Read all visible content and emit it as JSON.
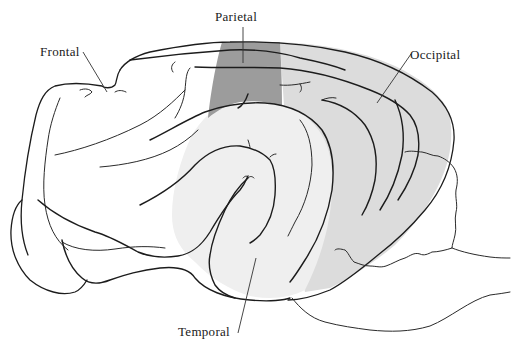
{
  "figure": {
    "labels": {
      "frontal": "Frontal",
      "parietal": "Parietal",
      "occipital": "Occipital",
      "temporal": "Temporal"
    },
    "colors": {
      "parietal_fill": "#9c9c9c",
      "occipital_fill": "#dcdcdc",
      "temporal_fill": "#efefef",
      "frontal_fill": "#ffffff",
      "line": "#1c1c1c",
      "background": "#ffffff"
    }
  }
}
